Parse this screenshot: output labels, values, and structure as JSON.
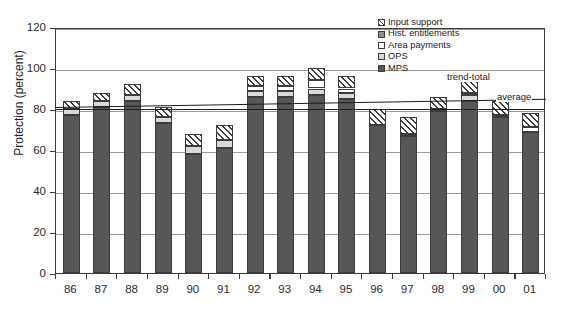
{
  "top_clipped_caption": "",
  "chart_data": {
    "type": "bar",
    "subtype": "stacked-bar-with-trendlines",
    "title": "",
    "xlabel": "",
    "ylabel": "Protection (percent)",
    "ylim": [
      0,
      120
    ],
    "yticks": [
      0,
      20,
      40,
      60,
      80,
      100,
      120
    ],
    "grid": true,
    "legend_position": "top-right",
    "categories": [
      "86",
      "87",
      "88",
      "89",
      "90",
      "91",
      "92",
      "93",
      "94",
      "95",
      "96",
      "97",
      "98",
      "99",
      "00",
      "01"
    ],
    "series": [
      {
        "name": "MPS",
        "swatch": "mps",
        "values": [
          77,
          81,
          84,
          73,
          58,
          61,
          86,
          86,
          87,
          85,
          72,
          67,
          79,
          84,
          76,
          69
        ]
      },
      {
        "name": "OPS",
        "swatch": "ops",
        "values": [
          3,
          3,
          3,
          3,
          4,
          4,
          3,
          3,
          3,
          3,
          0,
          0,
          0,
          3,
          0,
          0
        ]
      },
      {
        "name": "Area payments",
        "swatch": "area",
        "values": [
          0,
          0,
          0,
          0,
          0,
          0,
          2,
          2,
          4,
          2,
          0,
          1,
          1,
          1,
          1,
          2
        ]
      },
      {
        "name": "Hist. entitlements",
        "swatch": "hist",
        "values": [
          0,
          0,
          0,
          0,
          0,
          0,
          0,
          0,
          0,
          0,
          0,
          0,
          0,
          0,
          0,
          0
        ]
      },
      {
        "name": "Input support",
        "swatch": "input",
        "values": [
          4,
          4,
          5,
          5,
          6,
          7,
          5,
          5,
          6,
          6,
          8,
          8,
          6,
          6,
          7,
          7
        ]
      }
    ],
    "totals": [
      84,
      88,
      92,
      81,
      68,
      72,
      96,
      96,
      100,
      96,
      80,
      76,
      86,
      94,
      84,
      78
    ],
    "trend_lines": [
      {
        "name": "trend-total",
        "label": "trend-total",
        "start_value": 82,
        "end_value": 86
      },
      {
        "name": "average",
        "label": "average",
        "start_value": 81,
        "end_value": 81
      }
    ]
  },
  "legend": {
    "items": [
      {
        "label": "Input support",
        "swatch": "input"
      },
      {
        "label": "Hist. entitlements",
        "swatch": "hist"
      },
      {
        "label": "Area payments",
        "swatch": "area"
      },
      {
        "label": "OPS",
        "swatch": "ops"
      },
      {
        "label": "MPS",
        "swatch": "mps"
      }
    ]
  },
  "colors": {
    "mps": "#575757",
    "ops": "#d9d9d9",
    "area": "#ffffff",
    "hist": "#8e8e8e",
    "axis": "#3a3a3a",
    "grid": "#9a9a9a"
  }
}
